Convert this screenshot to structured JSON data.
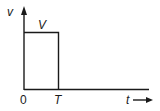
{
  "diagram": {
    "type": "rectangular-pulse",
    "labels": {
      "y_axis": "v",
      "amplitude": "V",
      "origin": "0",
      "pulse_end": "T",
      "x_axis": "t"
    },
    "colors": {
      "line": "#1a1a1a",
      "background": "#ffffff"
    }
  }
}
